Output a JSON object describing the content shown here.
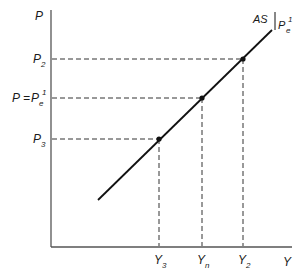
{
  "diagram": {
    "axes": {
      "y_label": "P",
      "x_label": "Y"
    },
    "curve": {
      "label_main": "AS",
      "label_sub_base": "P",
      "label_sub_sub": "e",
      "label_sub_sup": "1"
    },
    "y_ticks": [
      {
        "id": "p2",
        "base": "P",
        "sub": "2",
        "prefix": "",
        "sup": ""
      },
      {
        "id": "pe",
        "base": "P",
        "sub": "e",
        "prefix": "P = ",
        "sup": "1"
      },
      {
        "id": "p3",
        "base": "P",
        "sub": "3",
        "prefix": "",
        "sup": ""
      }
    ],
    "x_ticks": [
      {
        "id": "y3",
        "base": "Y",
        "sub": "3"
      },
      {
        "id": "yn",
        "base": "Y",
        "sub": "n"
      },
      {
        "id": "y2",
        "base": "Y",
        "sub": "2"
      }
    ],
    "points": [
      {
        "name": "point-p3-y3",
        "x_label": "Y3",
        "y_label": "P3"
      },
      {
        "name": "point-pe-yn",
        "x_label": "Yn",
        "y_label": "P = Pe1"
      },
      {
        "name": "point-p2-y2",
        "x_label": "Y2",
        "y_label": "P2"
      }
    ]
  }
}
